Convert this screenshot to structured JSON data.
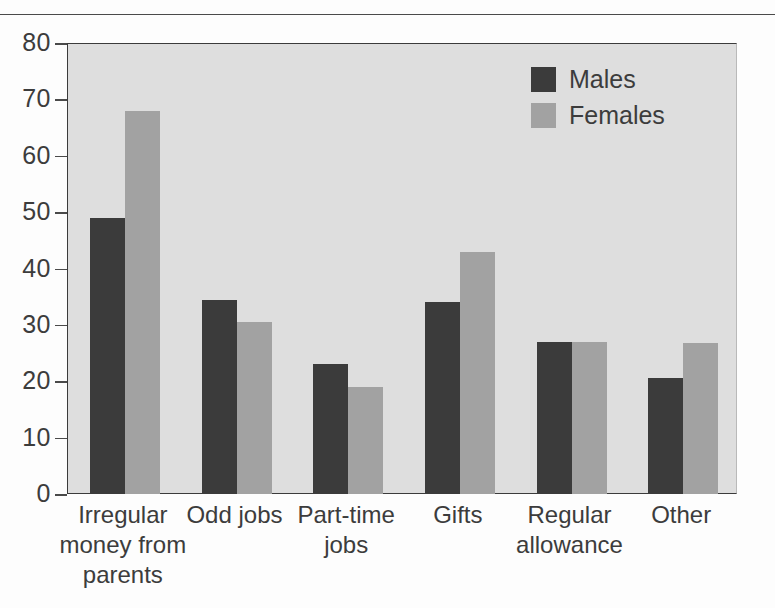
{
  "chart_data": {
    "type": "bar",
    "title": "",
    "subtitle": "",
    "xlabel": "",
    "ylabel": "",
    "ylim": [
      0,
      80
    ],
    "yticks": [
      0,
      10,
      20,
      30,
      40,
      50,
      60,
      70,
      80
    ],
    "grid": false,
    "legend_position": "top-right",
    "categories": [
      "Irregular money from parents",
      "Odd jobs",
      "Part-time jobs",
      "Gifts",
      "Regular allowance",
      "Other"
    ],
    "category_lines": [
      [
        "Irregular",
        "money from",
        "parents"
      ],
      [
        "Odd jobs"
      ],
      [
        "Part-time",
        "jobs"
      ],
      [
        "Gifts"
      ],
      [
        "Regular",
        "allowance"
      ],
      [
        "Other"
      ]
    ],
    "series": [
      {
        "name": "Males",
        "color": "#3b3b3b",
        "values": [
          49,
          34.5,
          23,
          34,
          27,
          20.5
        ]
      },
      {
        "name": "Females",
        "color": "#a2a2a2",
        "values": [
          68,
          30.5,
          19,
          43,
          27,
          26.7
        ]
      }
    ],
    "colors": {
      "males": "#3b3b3b",
      "females": "#a2a2a2",
      "plot_background": "#dedede",
      "axis": "#3b3b3b",
      "text": "#3c3c3c",
      "page_background": "#fdfdfd"
    }
  },
  "legend": {
    "items": [
      {
        "label": "Males",
        "swatch": "males"
      },
      {
        "label": "Females",
        "swatch": "females"
      }
    ]
  }
}
